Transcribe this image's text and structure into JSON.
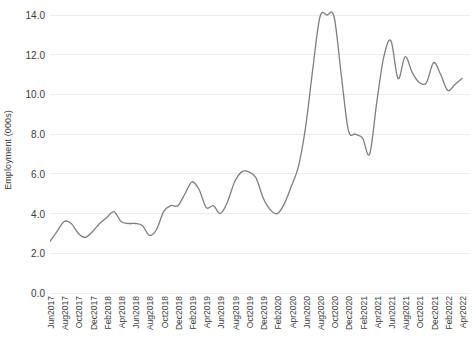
{
  "chart_data": {
    "type": "line",
    "title": "",
    "xlabel": "",
    "ylabel": "Employment (000s)",
    "ylim": [
      0.0,
      14.0
    ],
    "ytick_labels": [
      "14.0",
      "12.0",
      "10.0",
      "8.0",
      "6.0",
      "4.0",
      "2.0",
      "0.0"
    ],
    "ytick_values": [
      14.0,
      12.0,
      10.0,
      8.0,
      6.0,
      4.0,
      2.0,
      0.0
    ],
    "grid": true,
    "legend": "none",
    "line_color": "#7f7f7f",
    "x_tick_labels": [
      "Jun2017",
      "Aug2017",
      "Oct2017",
      "Dec2017",
      "Feb2018",
      "Apr2018",
      "Jun2018",
      "Aug2018",
      "Oct2018",
      "Dec2018",
      "Feb2019",
      "Apr2019",
      "Jun2019",
      "Aug2019",
      "Oct2019",
      "Dec2019",
      "Feb2020",
      "Apr2020",
      "Jun2020",
      "Aug2020",
      "Oct2020",
      "Dec2020",
      "Feb2021",
      "Apr2021",
      "Jun2021",
      "Aug2021",
      "Oct2021",
      "Dec2021",
      "Feb2022",
      "Apr2022"
    ],
    "x": [
      "Jun2017",
      "Jul2017",
      "Aug2017",
      "Sep2017",
      "Oct2017",
      "Nov2017",
      "Dec2017",
      "Jan2018",
      "Feb2018",
      "Mar2018",
      "Apr2018",
      "May2018",
      "Jun2018",
      "Jul2018",
      "Aug2018",
      "Sep2018",
      "Oct2018",
      "Nov2018",
      "Dec2018",
      "Jan2019",
      "Feb2019",
      "Mar2019",
      "Apr2019",
      "May2019",
      "Jun2019",
      "Jul2019",
      "Aug2019",
      "Sep2019",
      "Oct2019",
      "Nov2019",
      "Dec2019",
      "Jan2020",
      "Feb2020",
      "Mar2020",
      "Apr2020",
      "May2020",
      "Jun2020",
      "Jul2020",
      "Aug2020",
      "Sep2020",
      "Oct2020",
      "Nov2020",
      "Dec2020",
      "Jan2021",
      "Feb2021",
      "Mar2021",
      "Apr2021",
      "May2021",
      "Jun2021",
      "Jul2021",
      "Aug2021",
      "Sep2021",
      "Oct2021",
      "Nov2021",
      "Dec2021",
      "Jan2022",
      "Feb2022",
      "Mar2022",
      "Apr2022"
    ],
    "values": [
      2.6,
      3.1,
      3.6,
      3.5,
      3.0,
      2.8,
      3.1,
      3.5,
      3.8,
      4.1,
      3.6,
      3.5,
      3.5,
      3.4,
      2.9,
      3.2,
      4.1,
      4.4,
      4.4,
      5.0,
      5.6,
      5.2,
      4.3,
      4.4,
      4.0,
      4.6,
      5.6,
      6.1,
      6.1,
      5.8,
      4.8,
      4.2,
      4.0,
      4.5,
      5.4,
      6.4,
      8.4,
      11.3,
      13.9,
      14.0,
      13.9,
      11.0,
      8.2,
      8.0,
      7.8,
      7.0,
      9.6,
      11.9,
      12.7,
      10.8,
      11.9,
      11.1,
      10.6,
      10.6,
      11.6,
      11.0,
      10.2,
      10.5,
      10.8
    ]
  }
}
